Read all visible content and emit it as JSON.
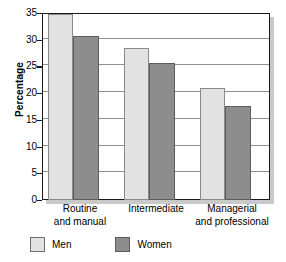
{
  "chart_data": {
    "type": "bar",
    "title": "",
    "xlabel": "",
    "ylabel": "Percentage",
    "ylim": [
      0,
      35
    ],
    "ytick_step": 5,
    "yticks": [
      0,
      5,
      10,
      15,
      20,
      25,
      30,
      35
    ],
    "ytick_labels": [
      "0",
      "5",
      "10",
      "15",
      "20",
      "25",
      "30",
      "35"
    ],
    "grid": true,
    "grid_axis": "y",
    "legend_position": "bottom-left",
    "categories": [
      "Routine and manual",
      "Intermediate",
      "Managerial and professional"
    ],
    "category_lines": [
      [
        "Routine",
        "and manual"
      ],
      [
        "Intermediate",
        ""
      ],
      [
        "Managerial",
        "and professional"
      ]
    ],
    "series": [
      {
        "name": "Men",
        "color": "#e2e2e2",
        "values": [
          34.9,
          28.4,
          21.0
        ]
      },
      {
        "name": "Women",
        "color": "#8d8d8d",
        "values": [
          30.7,
          25.7,
          17.6
        ]
      }
    ]
  },
  "legend": {
    "items": [
      {
        "label": "Men",
        "swatch": "men-swatch"
      },
      {
        "label": "Women",
        "swatch": "women-swatch"
      }
    ]
  }
}
